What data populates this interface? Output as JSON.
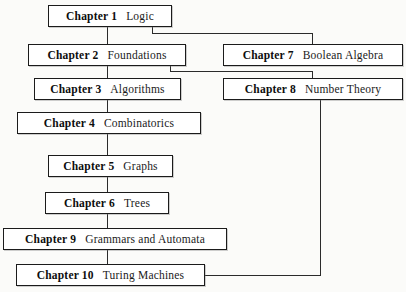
{
  "diagram": {
    "background_color": "#fbfbf9",
    "line_color": "#2b2b2b",
    "box_border_color": "#1b1b1b",
    "box_fill_color": "#ffffff",
    "nodes": [
      {
        "id": "ch1",
        "number": "Chapter 1",
        "title": "Logic",
        "x": 48,
        "y": 5,
        "w": 124
      },
      {
        "id": "ch2",
        "number": "Chapter 2",
        "title": "Foundations",
        "x": 28,
        "y": 44,
        "w": 158
      },
      {
        "id": "ch7",
        "number": "Chapter 7",
        "title": "Boolean Algebra",
        "x": 223,
        "y": 44,
        "w": 180
      },
      {
        "id": "ch3",
        "number": "Chapter 3",
        "title": "Algorithms",
        "x": 34,
        "y": 78,
        "w": 147
      },
      {
        "id": "ch8",
        "number": "Chapter 8",
        "title": "Number Theory",
        "x": 223,
        "y": 78,
        "w": 180
      },
      {
        "id": "ch4",
        "number": "Chapter 4",
        "title": "Combinatorics",
        "x": 17,
        "y": 112,
        "w": 184
      },
      {
        "id": "ch5",
        "number": "Chapter 5",
        "title": "Graphs",
        "x": 48,
        "y": 155,
        "w": 125
      },
      {
        "id": "ch6",
        "number": "Chapter 6",
        "title": "Trees",
        "x": 45,
        "y": 192,
        "w": 124
      },
      {
        "id": "ch9",
        "number": "Chapter 9",
        "title": "Grammars and Automata",
        "x": 3,
        "y": 228,
        "w": 224
      },
      {
        "id": "ch10",
        "number": "Chapter 10",
        "title": "Turing Machines",
        "x": 16,
        "y": 264,
        "w": 189
      }
    ],
    "edges": [
      {
        "id": "e1-2",
        "from": "ch1",
        "to": "ch2",
        "label": "Chapter 1 to Chapter 2"
      },
      {
        "id": "e1-7",
        "from": "ch1",
        "to": "ch7",
        "label": "Chapter 1 to Chapter 7"
      },
      {
        "id": "e2-3",
        "from": "ch2",
        "to": "ch3",
        "label": "Chapter 2 to Chapter 3"
      },
      {
        "id": "e2-8",
        "from": "ch2",
        "to": "ch8",
        "label": "Chapter 2 to Chapter 8"
      },
      {
        "id": "e3-4",
        "from": "ch3",
        "to": "ch4",
        "label": "Chapter 3 to Chapter 4"
      },
      {
        "id": "e4-5",
        "from": "ch4",
        "to": "ch5",
        "label": "Chapter 4 to Chapter 5"
      },
      {
        "id": "e5-6",
        "from": "ch5",
        "to": "ch6",
        "label": "Chapter 5 to Chapter 6"
      },
      {
        "id": "e6-9",
        "from": "ch6",
        "to": "ch9",
        "label": "Chapter 6 to Chapter 9"
      },
      {
        "id": "e9-10",
        "from": "ch9",
        "to": "ch10",
        "label": "Chapter 9 to Chapter 10"
      },
      {
        "id": "e8-10",
        "from": "ch8",
        "to": "ch10",
        "label": "Chapter 8 to Chapter 10"
      }
    ]
  }
}
